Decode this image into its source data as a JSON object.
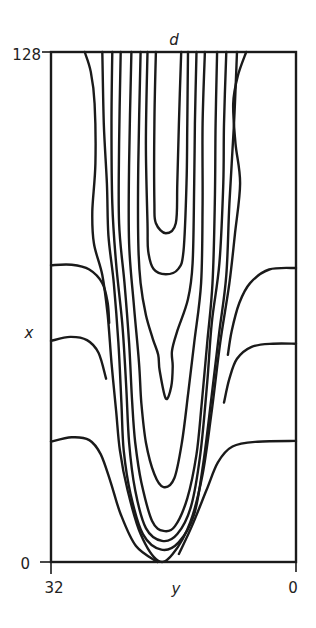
{
  "chart_data": {
    "type": "contour",
    "title": "d",
    "xlabel": "y",
    "ylabel": "x",
    "x_axis": {
      "variable": "y",
      "range": [
        32,
        0
      ],
      "ticks": [
        "32",
        "0"
      ]
    },
    "y_axis": {
      "variable": "x",
      "range": [
        0,
        128
      ],
      "ticks": [
        "0",
        "128"
      ]
    },
    "grid": false,
    "legend": "none",
    "contours": [
      {
        "name": "inner-u-1",
        "points": [
          [
            18.3,
            128
          ],
          [
            18.5,
            110
          ],
          [
            18.5,
            90
          ],
          [
            18.3,
            85
          ],
          [
            17.0,
            82.5
          ],
          [
            15.7,
            85
          ],
          [
            15.5,
            95
          ],
          [
            15.3,
            110
          ],
          [
            15.0,
            128
          ]
        ]
      },
      {
        "name": "inner-u-2",
        "points": [
          [
            19.4,
            128
          ],
          [
            19.6,
            105
          ],
          [
            19.4,
            85
          ],
          [
            19.3,
            78
          ],
          [
            18.6,
            73.5
          ],
          [
            17.0,
            72.2
          ],
          [
            15.4,
            73.5
          ],
          [
            14.7,
            78
          ],
          [
            14.3,
            95
          ],
          [
            14.2,
            110
          ],
          [
            14.1,
            128
          ]
        ]
      },
      {
        "name": "pinched-loop",
        "points": [
          [
            20.3,
            128
          ],
          [
            20.6,
            100
          ],
          [
            20.6,
            80
          ],
          [
            20.3,
            70
          ],
          [
            19.6,
            62
          ],
          [
            18.7,
            56
          ],
          [
            18.0,
            52
          ],
          [
            17.8,
            48
          ],
          [
            17.0,
            41
          ],
          [
            16.3,
            44
          ],
          [
            16.1,
            49
          ],
          [
            16.2,
            53
          ],
          [
            15.5,
            58
          ],
          [
            14.1,
            66
          ],
          [
            13.5,
            75
          ],
          [
            13.3,
            95
          ],
          [
            13.2,
            110
          ],
          [
            13.0,
            128
          ]
        ]
      },
      {
        "name": "mid-u-1",
        "points": [
          [
            21.5,
            128
          ],
          [
            21.8,
            100
          ],
          [
            21.8,
            80
          ],
          [
            21.2,
            65
          ],
          [
            20.5,
            50
          ],
          [
            20.2,
            40
          ],
          [
            19.6,
            30
          ],
          [
            18.5,
            22
          ],
          [
            17.3,
            18.8
          ],
          [
            15.9,
            21
          ],
          [
            14.9,
            30
          ],
          [
            14.1,
            42
          ],
          [
            13.3,
            55
          ],
          [
            12.4,
            70
          ],
          [
            12.2,
            90
          ],
          [
            12.2,
            110
          ],
          [
            11.9,
            128
          ]
        ]
      },
      {
        "name": "mid-u-2",
        "points": [
          [
            22.9,
            128
          ],
          [
            23.1,
            105
          ],
          [
            23.1,
            85
          ],
          [
            22.4,
            70
          ],
          [
            21.8,
            55
          ],
          [
            21.4,
            40
          ],
          [
            21.0,
            30
          ],
          [
            20.2,
            20
          ],
          [
            18.8,
            10.3
          ],
          [
            17.3,
            7.8
          ],
          [
            15.8,
            9
          ],
          [
            14.2,
            16
          ],
          [
            13.0,
            27
          ],
          [
            12.3,
            40
          ],
          [
            11.6,
            55
          ],
          [
            10.9,
            70
          ],
          [
            10.6,
            90
          ],
          [
            10.5,
            110
          ],
          [
            10.3,
            128
          ]
        ]
      },
      {
        "name": "mid-u-3",
        "points": [
          [
            24.0,
            128
          ],
          [
            24.1,
            110
          ],
          [
            24.0,
            90
          ],
          [
            23.5,
            75
          ],
          [
            22.7,
            60
          ],
          [
            22.2,
            45
          ],
          [
            21.8,
            30
          ],
          [
            21.0,
            18
          ],
          [
            19.6,
            8.5
          ],
          [
            17.5,
            5.3
          ],
          [
            15.5,
            7
          ],
          [
            13.7,
            14
          ],
          [
            12.5,
            27
          ],
          [
            11.6,
            45
          ],
          [
            11.0,
            60
          ],
          [
            10.0,
            75
          ],
          [
            9.5,
            95
          ],
          [
            9.4,
            110
          ],
          [
            9.1,
            128
          ]
        ]
      },
      {
        "name": "mid-u-4",
        "points": [
          [
            25.3,
            128
          ],
          [
            25.1,
            110
          ],
          [
            24.7,
            95
          ],
          [
            24.5,
            82
          ],
          [
            23.8,
            70
          ],
          [
            23.2,
            55
          ],
          [
            22.8,
            40
          ],
          [
            22.5,
            28
          ],
          [
            21.6,
            17
          ],
          [
            20.0,
            7
          ],
          [
            17.6,
            3.1
          ],
          [
            15.3,
            5
          ],
          [
            13.3,
            12
          ],
          [
            12.1,
            25
          ],
          [
            11.0,
            42
          ],
          [
            10.0,
            58
          ],
          [
            9.1,
            72
          ],
          [
            8.7,
            90
          ],
          [
            8.1,
            110
          ],
          [
            7.7,
            128
          ]
        ]
      },
      {
        "name": "outer-u",
        "points": [
          [
            27.6,
            128
          ],
          [
            26.8,
            123
          ],
          [
            26.3,
            115
          ],
          [
            26.2,
            100
          ],
          [
            26.6,
            88
          ],
          [
            26.4,
            80
          ],
          [
            25.3,
            72
          ],
          [
            24.6,
            62
          ],
          [
            24.1,
            50
          ],
          [
            23.5,
            38
          ],
          [
            23.0,
            28
          ],
          [
            22.0,
            18
          ],
          [
            20.3,
            7
          ],
          [
            18.0,
            0.3
          ],
          [
            16.1,
            2
          ],
          [
            13.8,
            10
          ],
          [
            12.2,
            22
          ],
          [
            11.0,
            38
          ],
          [
            9.9,
            55
          ],
          [
            8.7,
            70
          ],
          [
            8.0,
            82
          ],
          [
            7.3,
            95
          ],
          [
            7.9,
            105
          ],
          [
            8.2,
            115
          ],
          [
            7.6,
            122
          ],
          [
            6.5,
            128
          ]
        ]
      },
      {
        "name": "side-level-high",
        "points": [
          [
            32,
            74.5
          ],
          [
            29.3,
            74.6
          ],
          [
            27.0,
            73.4
          ],
          [
            25.3,
            70
          ],
          [
            24.6,
            65
          ],
          [
            24.4,
            60
          ]
        ],
        "continues": [
          [
            8.9,
            52
          ],
          [
            8.4,
            58
          ],
          [
            7.4,
            65
          ],
          [
            6.0,
            70
          ],
          [
            3.5,
            73.4
          ],
          [
            0,
            73.8
          ]
        ]
      },
      {
        "name": "side-level-mid",
        "points": [
          [
            32,
            55.5
          ],
          [
            29.5,
            56.5
          ],
          [
            27.3,
            55.7
          ],
          [
            25.8,
            52.5
          ],
          [
            24.8,
            46
          ]
        ],
        "continues": [
          [
            9.4,
            40
          ],
          [
            8.7,
            46
          ],
          [
            7.7,
            51
          ],
          [
            5.8,
            54
          ],
          [
            3.0,
            54.8
          ],
          [
            0,
            54.8
          ]
        ]
      },
      {
        "name": "side-level-low",
        "points": [
          [
            32,
            30.2
          ],
          [
            29.3,
            31.3
          ],
          [
            27.0,
            30.6
          ],
          [
            25.5,
            27
          ],
          [
            24.2,
            20
          ],
          [
            22.9,
            12
          ],
          [
            20.9,
            4
          ],
          [
            18.1,
            0
          ]
        ],
        "continues": [
          [
            15.3,
            2
          ],
          [
            13.6,
            9
          ],
          [
            11.7,
            18
          ],
          [
            10.2,
            25
          ],
          [
            8.3,
            29
          ],
          [
            5.0,
            30.2
          ],
          [
            0,
            30.4
          ]
        ]
      }
    ]
  }
}
